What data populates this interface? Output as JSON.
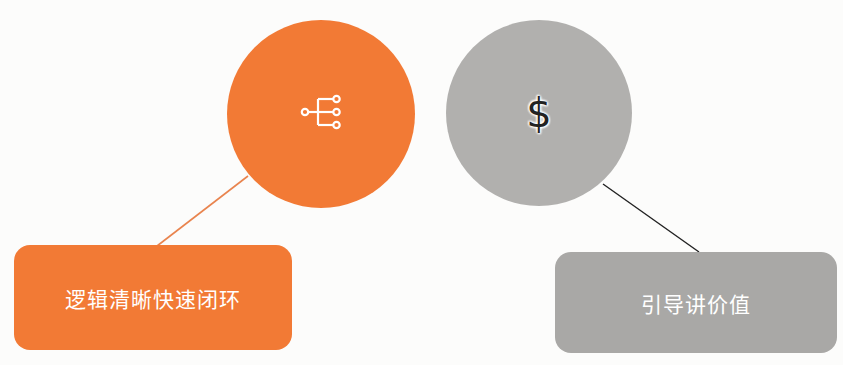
{
  "colors": {
    "orange": "#f27a35",
    "gray": "#b1b0ae",
    "gray_box": "#a9a8a6",
    "orange_line": "#e9844e",
    "dark_line": "#222222",
    "background": "#fcfcfb"
  },
  "nodes": [
    {
      "icon": "hierarchy-branch-icon",
      "label": "逻辑清晰快速闭环",
      "color": "#f27a35"
    },
    {
      "icon": "dollar-icon",
      "icon_glyph": "$",
      "label": "引导讲价值",
      "color": "#b1b0ae"
    }
  ]
}
